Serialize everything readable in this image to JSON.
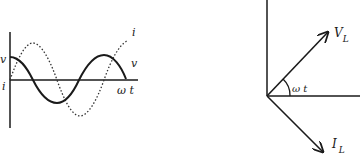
{
  "waveform_graph": {
    "labels": {
      "v_axis": "v",
      "i_axis": "i",
      "i_curve": "i",
      "v_curve": "v",
      "time_axis": "ω t"
    },
    "series": [
      {
        "name": "v",
        "style": "solid",
        "description": "voltage, cosine starting at peak"
      },
      {
        "name": "i",
        "style": "dotted",
        "description": "current, sine starting at zero (lags voltage by 90°)"
      }
    ]
  },
  "phasor_diagram": {
    "labels": {
      "voltage_phasor": "V",
      "voltage_sub": "L",
      "current_phasor": "I",
      "current_sub": "L",
      "angle": "ω t"
    }
  },
  "colors": {
    "stroke": "#1a1a1a",
    "background": "#ffffff"
  }
}
